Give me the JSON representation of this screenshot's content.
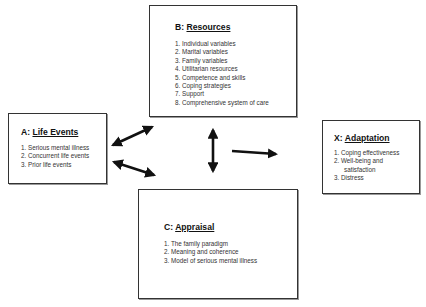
{
  "diagram": {
    "boxes": {
      "b": {
        "prefix": "B:",
        "title": "Resources",
        "items": [
          "1. Individual variables",
          "2. Marital variables",
          "3. Family variables",
          "4.  Utilitarian resources",
          "5.  Competence and skills",
          "6.  Coping strategies",
          "7.  Support",
          "8.  Comprehensive system of care"
        ]
      },
      "a": {
        "prefix": "A:",
        "title": "Life Events",
        "items": [
          "1.  Serious mental illness",
          "2.  Concurrent life events",
          "3.  Prior life events"
        ]
      },
      "x": {
        "prefix": "X:",
        "title": "Adaptation",
        "items": [
          "1.  Coping effectiveness",
          "2.  Well-being and satisfaction",
          "3.  Distress"
        ]
      },
      "c": {
        "prefix": "C:",
        "title": "Appraisal",
        "items": [
          "1.  The family paradigm",
          "2.  Meaning and coherence",
          "3.  Model of serious mental illness"
        ]
      }
    },
    "arrows": [
      {
        "from": "a",
        "to": "b",
        "type": "double-headed"
      },
      {
        "from": "a",
        "to": "c",
        "type": "double-headed"
      },
      {
        "from": "b",
        "to": "c",
        "type": "double-headed"
      },
      {
        "from": "center",
        "to": "x",
        "type": "single-headed"
      }
    ],
    "colors": {
      "stroke": "#111111",
      "box_border": "#333333",
      "background": "#ffffff"
    }
  }
}
